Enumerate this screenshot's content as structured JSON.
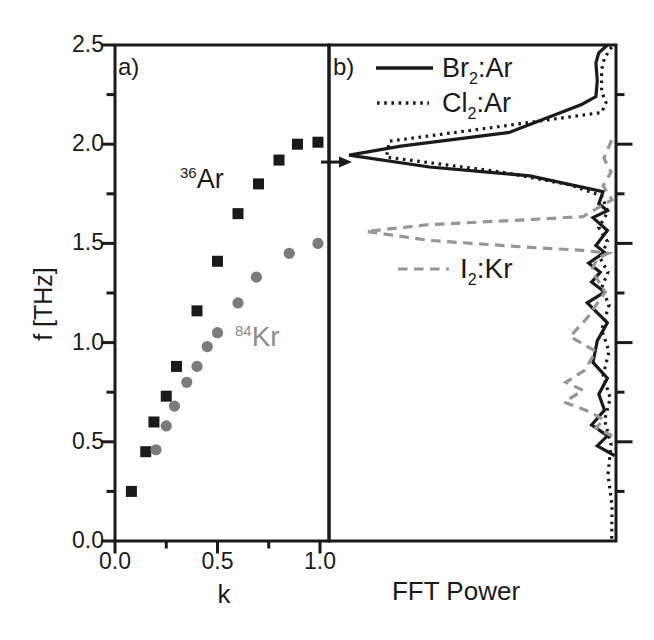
{
  "figure": {
    "colors": {
      "ink": "#1a1a1a",
      "marker_gray": "#7b7b7b",
      "dash_gray": "#969696",
      "label_gray": "#8e8e8e",
      "background": "#ffffff"
    },
    "y_axis": {
      "label": "f [THz]",
      "ticks": [
        {
          "v": 2.5,
          "label": "2.5"
        },
        {
          "v": 2.0,
          "label": "2.0"
        },
        {
          "v": 1.5,
          "label": "1.5"
        },
        {
          "v": 1.0,
          "label": "1.0"
        },
        {
          "v": 0.5,
          "label": "0.5"
        },
        {
          "v": 0.0,
          "label": "0.0"
        }
      ]
    },
    "panel_a": {
      "tag": "a)",
      "x_label": "k",
      "x_ticks": [
        {
          "v": 0.0,
          "label": "0.0"
        },
        {
          "v": 0.5,
          "label": "0.5"
        },
        {
          "v": 1.0,
          "label": "1.0"
        }
      ],
      "annotations": [
        {
          "sup": "36",
          "text": "Ar"
        },
        {
          "sup": "84",
          "text": "Kr"
        }
      ]
    },
    "panel_b": {
      "tag": "b)",
      "x_label": "FFT Power",
      "legend": [
        {
          "pre": "Br",
          "sub": "2",
          "post": ":Ar"
        },
        {
          "pre": "Cl",
          "sub": "2",
          "post": ":Ar"
        },
        {
          "pre": "I",
          "sub": "2",
          "post": ":Kr"
        }
      ]
    }
  },
  "chart_data": [
    {
      "panel": "a",
      "type": "scatter",
      "title": "",
      "xlabel": "k",
      "ylabel": "f [THz]",
      "xlim": [
        0,
        1.05
      ],
      "ylim": [
        0,
        2.5
      ],
      "xticks": [
        0,
        0.5,
        1.0
      ],
      "yticks": [
        0,
        0.5,
        1.0,
        1.5,
        2.0,
        2.5
      ],
      "minor_tick_step": 0.25,
      "grid": false,
      "series": [
        {
          "name": "36Ar",
          "marker": "square",
          "color": "#1a1a1a",
          "points": [
            [
              0.08,
              0.25
            ],
            [
              0.15,
              0.45
            ],
            [
              0.19,
              0.6
            ],
            [
              0.25,
              0.73
            ],
            [
              0.3,
              0.88
            ],
            [
              0.4,
              1.16
            ],
            [
              0.5,
              1.41
            ],
            [
              0.6,
              1.65
            ],
            [
              0.7,
              1.8
            ],
            [
              0.8,
              1.92
            ],
            [
              0.89,
              2.0
            ],
            [
              0.99,
              2.01
            ]
          ]
        },
        {
          "name": "84Kr",
          "marker": "circle",
          "color": "#7b7b7b",
          "points": [
            [
              0.2,
              0.46
            ],
            [
              0.25,
              0.58
            ],
            [
              0.29,
              0.68
            ],
            [
              0.35,
              0.8
            ],
            [
              0.4,
              0.88
            ],
            [
              0.45,
              0.98
            ],
            [
              0.5,
              1.05
            ],
            [
              0.6,
              1.2
            ],
            [
              0.69,
              1.33
            ],
            [
              0.85,
              1.45
            ],
            [
              0.99,
              1.5
            ]
          ]
        }
      ]
    },
    {
      "panel": "b",
      "type": "line",
      "title": "",
      "xlabel": "FFT Power",
      "ylabel": "f [THz]",
      "ylim": [
        0,
        2.5
      ],
      "power_axis_note": "power in arbitrary units 0-1, increasing leftward from the right-hand axis",
      "arrow": {
        "f": 1.91,
        "points": "right"
      },
      "peaks": [
        {
          "series": "Br2:Ar",
          "f": 1.95
        },
        {
          "series": "Cl2:Ar",
          "f": 2.0
        },
        {
          "series": "I2:Kr",
          "f": 1.56
        }
      ],
      "series": [
        {
          "name": "Br2:Ar",
          "style": "solid",
          "color": "#1a1a1a",
          "points": [
            [
              2.5,
              0.03
            ],
            [
              2.46,
              0.06
            ],
            [
              2.41,
              0.07
            ],
            [
              2.32,
              0.065
            ],
            [
              2.24,
              0.07
            ],
            [
              2.2,
              0.12
            ],
            [
              2.06,
              0.37
            ],
            [
              1.99,
              0.75
            ],
            [
              1.945,
              0.93
            ],
            [
              1.885,
              0.65
            ],
            [
              1.84,
              0.3
            ],
            [
              1.76,
              0.045
            ],
            [
              1.7,
              0.06
            ],
            [
              1.665,
              0.03
            ],
            [
              1.63,
              0.08
            ],
            [
              1.565,
              0.03
            ],
            [
              1.49,
              0.07
            ],
            [
              1.455,
              0.04
            ],
            [
              1.4,
              0.095
            ],
            [
              1.355,
              0.055
            ],
            [
              1.305,
              0.085
            ],
            [
              1.255,
              0.04
            ],
            [
              1.2,
              0.1
            ],
            [
              1.1,
              0.03
            ],
            [
              1.01,
              0.065
            ],
            [
              0.9,
              0.08
            ],
            [
              0.82,
              0.03
            ],
            [
              0.74,
              0.06
            ],
            [
              0.66,
              0.04
            ],
            [
              0.585,
              0.085
            ],
            [
              0.53,
              0.03
            ],
            [
              0.48,
              0.065
            ],
            [
              0.43,
              0.005
            ]
          ]
        },
        {
          "name": "Cl2:Ar",
          "style": "dotted",
          "color": "#1a1a1a",
          "points": [
            [
              2.49,
              0.015
            ],
            [
              2.435,
              0.04
            ],
            [
              2.375,
              0.05
            ],
            [
              2.265,
              0.05
            ],
            [
              2.21,
              0.035
            ],
            [
              2.16,
              0.05
            ],
            [
              2.09,
              0.4
            ],
            [
              2.015,
              0.79
            ],
            [
              1.935,
              0.8
            ],
            [
              1.86,
              0.4
            ],
            [
              1.795,
              0.16
            ],
            [
              1.74,
              0.05
            ],
            [
              1.66,
              0.028
            ],
            [
              1.58,
              0.06
            ],
            [
              1.51,
              0.03
            ],
            [
              1.425,
              0.055
            ],
            [
              1.355,
              0.028
            ],
            [
              1.275,
              0.05
            ],
            [
              1.19,
              0.024
            ],
            [
              1.065,
              0.05
            ],
            [
              0.955,
              0.024
            ],
            [
              0.835,
              0.045
            ],
            [
              0.72,
              0.02
            ],
            [
              0.61,
              0.04
            ],
            [
              0.485,
              0.017
            ],
            [
              0.335,
              0.028
            ],
            [
              0.18,
              0.014
            ],
            [
              0.005,
              0.015
            ]
          ]
        },
        {
          "name": "I2:Kr",
          "style": "dashed",
          "color": "#969696",
          "points": [
            [
              2.02,
              0.015
            ],
            [
              1.93,
              0.042
            ],
            [
              1.86,
              0.017
            ],
            [
              1.79,
              0.045
            ],
            [
              1.72,
              0.014
            ],
            [
              1.635,
              0.115
            ],
            [
              1.62,
              0.3
            ],
            [
              1.595,
              0.65
            ],
            [
              1.56,
              0.87
            ],
            [
              1.515,
              0.65
            ],
            [
              1.48,
              0.3
            ],
            [
              1.465,
              0.115
            ],
            [
              1.45,
              0.028
            ],
            [
              1.425,
              0.065
            ],
            [
              1.365,
              0.085
            ],
            [
              1.255,
              0.038
            ],
            [
              1.125,
              0.1
            ],
            [
              1.03,
              0.16
            ],
            [
              0.955,
              0.07
            ],
            [
              0.86,
              0.11
            ],
            [
              0.8,
              0.175
            ],
            [
              0.76,
              0.115
            ],
            [
              0.7,
              0.18
            ],
            [
              0.65,
              0.09
            ],
            [
              0.61,
              0.042
            ],
            [
              0.57,
              0.07
            ],
            [
              0.53,
              0.014
            ]
          ]
        }
      ]
    }
  ]
}
